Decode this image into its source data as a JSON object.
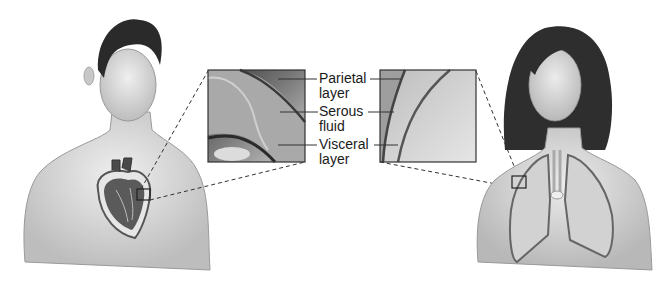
{
  "figure": {
    "colors": {
      "background": "#ffffff",
      "line": "#333333",
      "skin": "#d9d9d9",
      "hair": "#2a2a2a"
    },
    "left_panel": {
      "subject": "male torso with heart in pericardium",
      "organ": "heart"
    },
    "right_panel": {
      "subject": "female torso with lungs in pleura",
      "organ": "lungs"
    },
    "labels": [
      {
        "id": "parietal",
        "text": "Parietal\nlayer"
      },
      {
        "id": "serous",
        "text": "Serous\nfluid"
      },
      {
        "id": "visceral",
        "text": "Visceral\nlayer"
      }
    ]
  }
}
